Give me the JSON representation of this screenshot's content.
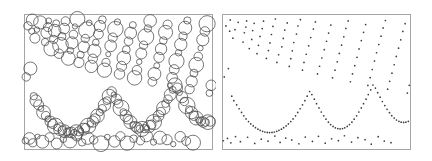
{
  "figure": {
    "type": "two-panel-point-pattern",
    "background_color": "#ffffff",
    "panel_count": 2,
    "title": "",
    "caption": ""
  },
  "panels": [
    {
      "id": "panel-circles",
      "name": "left-panel-circles",
      "label": "",
      "mark_style": "open-circle",
      "mark_stroke_color": "#4a4a4a",
      "mark_fill": "none",
      "frame": {
        "x": 24,
        "y": 14,
        "width": 188,
        "height": 135
      },
      "frame_color": "#8e8e8e",
      "point_count": 194
    },
    {
      "id": "panel-dots",
      "name": "right-panel-dots",
      "label": "",
      "mark_style": "filled-dot",
      "mark_stroke_color": "#3a3a3a",
      "mark_fill": "#3a3a3a",
      "frame": {
        "x": 6,
        "y": 14,
        "width": 188,
        "height": 135
      },
      "frame_color": "#8e8e8e",
      "point_count": 194
    }
  ],
  "chart_data": {
    "type": "scatter",
    "title": "",
    "subtitle": "",
    "xlabel": "",
    "ylabel": "",
    "xlim": [
      0,
      1
    ],
    "ylim": [
      0,
      1
    ],
    "grid": false,
    "legend": null,
    "annotations": [],
    "tick_labels_x": [],
    "tick_labels_y": [],
    "series": [
      {
        "name": "points",
        "marks_encode": "circle radius",
        "radius_min_px": 2.4,
        "radius_max_px": 8.2,
        "x": [
          0.021,
          0.041,
          0.044,
          0.058,
          0.069,
          0.086,
          0.112,
          0.119,
          0.127,
          0.131,
          0.145,
          0.158,
          0.163,
          0.171,
          0.186,
          0.194,
          0.202,
          0.214,
          0.221,
          0.236,
          0.247,
          0.255,
          0.263,
          0.271,
          0.284,
          0.292,
          0.301,
          0.318,
          0.326,
          0.334,
          0.347,
          0.358,
          0.366,
          0.374,
          0.382,
          0.396,
          0.404,
          0.417,
          0.428,
          0.436,
          0.448,
          0.461,
          0.472,
          0.486,
          0.497,
          0.508,
          0.519,
          0.531,
          0.544,
          0.556,
          0.567,
          0.579,
          0.588,
          0.601,
          0.613,
          0.624,
          0.636,
          0.648,
          0.659,
          0.671,
          0.683,
          0.694,
          0.706,
          0.718,
          0.729,
          0.741,
          0.753,
          0.764,
          0.776,
          0.788,
          0.799,
          0.811,
          0.822,
          0.834,
          0.846,
          0.857,
          0.869,
          0.881,
          0.892,
          0.904,
          0.916,
          0.927,
          0.939,
          0.951,
          0.962,
          0.974,
          0.986,
          0.996,
          0.012,
          0.034,
          0.052,
          0.063,
          0.078,
          0.091,
          0.104,
          0.116,
          0.128,
          0.141,
          0.153,
          0.166,
          0.178,
          0.191,
          0.203,
          0.216,
          0.228,
          0.241,
          0.253,
          0.266,
          0.278,
          0.291,
          0.303,
          0.316,
          0.328,
          0.341,
          0.353,
          0.366,
          0.378,
          0.391,
          0.403,
          0.416,
          0.428,
          0.441,
          0.453,
          0.466,
          0.478,
          0.491,
          0.503,
          0.516,
          0.528,
          0.541,
          0.553,
          0.566,
          0.578,
          0.591,
          0.603,
          0.616,
          0.628,
          0.641,
          0.653,
          0.666,
          0.678,
          0.691,
          0.703,
          0.716,
          0.728,
          0.741,
          0.753,
          0.766,
          0.778,
          0.791,
          0.803,
          0.816,
          0.828,
          0.841,
          0.853,
          0.866,
          0.878,
          0.891,
          0.903,
          0.916,
          0.928,
          0.941,
          0.953,
          0.966,
          0.978,
          0.991,
          0.007,
          0.029,
          0.047,
          0.072,
          0.098,
          0.136,
          0.174,
          0.209,
          0.245,
          0.281,
          0.309,
          0.339,
          0.371,
          0.409,
          0.443,
          0.481,
          0.513,
          0.549,
          0.583,
          0.619,
          0.651,
          0.689,
          0.723,
          0.761,
          0.794,
          0.831,
          0.863,
          0.899
        ],
        "y": [
          0.912,
          0.873,
          0.956,
          0.821,
          0.884,
          0.938,
          0.792,
          0.861,
          0.903,
          0.949,
          0.744,
          0.812,
          0.877,
          0.931,
          0.706,
          0.768,
          0.834,
          0.892,
          0.947,
          0.671,
          0.729,
          0.786,
          0.848,
          0.908,
          0.963,
          0.641,
          0.698,
          0.757,
          0.819,
          0.881,
          0.934,
          0.612,
          0.669,
          0.727,
          0.789,
          0.851,
          0.911,
          0.958,
          0.584,
          0.641,
          0.702,
          0.764,
          0.826,
          0.888,
          0.941,
          0.556,
          0.613,
          0.674,
          0.736,
          0.798,
          0.859,
          0.918,
          0.527,
          0.584,
          0.646,
          0.708,
          0.769,
          0.831,
          0.893,
          0.949,
          0.498,
          0.556,
          0.617,
          0.679,
          0.741,
          0.803,
          0.864,
          0.922,
          0.471,
          0.528,
          0.589,
          0.651,
          0.713,
          0.774,
          0.836,
          0.897,
          0.952,
          0.443,
          0.501,
          0.562,
          0.624,
          0.686,
          0.747,
          0.809,
          0.871,
          0.928,
          0.414,
          0.472,
          0.534,
          0.596,
          0.391,
          0.358,
          0.327,
          0.298,
          0.271,
          0.246,
          0.223,
          0.203,
          0.186,
          0.171,
          0.158,
          0.147,
          0.138,
          0.131,
          0.126,
          0.123,
          0.122,
          0.123,
          0.126,
          0.131,
          0.138,
          0.147,
          0.158,
          0.171,
          0.186,
          0.203,
          0.223,
          0.246,
          0.271,
          0.298,
          0.327,
          0.358,
          0.391,
          0.426,
          0.403,
          0.369,
          0.336,
          0.304,
          0.274,
          0.246,
          0.221,
          0.199,
          0.181,
          0.167,
          0.157,
          0.151,
          0.149,
          0.151,
          0.157,
          0.167,
          0.181,
          0.199,
          0.221,
          0.246,
          0.274,
          0.304,
          0.336,
          0.369,
          0.403,
          0.438,
          0.474,
          0.451,
          0.417,
          0.384,
          0.352,
          0.322,
          0.294,
          0.269,
          0.247,
          0.229,
          0.215,
          0.205,
          0.199,
          0.197,
          0.199,
          0.205,
          0.061,
          0.078,
          0.046,
          0.092,
          0.054,
          0.087,
          0.041,
          0.073,
          0.058,
          0.096,
          0.049,
          0.081,
          0.067,
          0.039,
          0.088,
          0.056,
          0.094,
          0.043,
          0.076,
          0.062,
          0.098,
          0.051,
          0.084,
          0.069,
          0.036,
          0.091,
          0.059,
          0.047
        ],
        "marks": [
          4.1,
          3.2,
          5.6,
          4.8,
          2.9,
          6.1,
          3.7,
          5.2,
          4.4,
          3.1,
          6.8,
          4.0,
          5.9,
          3.5,
          4.6,
          7.2,
          3.9,
          5.1,
          4.3,
          6.4,
          3.3,
          5.7,
          4.2,
          2.8,
          6.9,
          4.9,
          3.6,
          5.4,
          4.1,
          7.5,
          3.0,
          5.8,
          4.5,
          6.2,
          3.4,
          4.7,
          5.3,
          3.8,
          6.6,
          4.0,
          2.7,
          5.5,
          4.4,
          7.1,
          3.2,
          5.0,
          4.8,
          6.3,
          3.9,
          4.2,
          5.6,
          3.5,
          6.7,
          4.6,
          2.9,
          5.2,
          4.1,
          7.3,
          3.7,
          5.9,
          4.3,
          6.0,
          3.1,
          4.9,
          5.4,
          3.8,
          6.5,
          4.4,
          2.6,
          5.1,
          4.7,
          7.0,
          3.3,
          5.8,
          4.0,
          6.2,
          3.6,
          4.5,
          5.3,
          3.9,
          6.8,
          4.2,
          2.8,
          5.7,
          4.6,
          7.4,
          3.4,
          5.0,
          4.1,
          6.1,
          3.7,
          5.5,
          4.8,
          2.9,
          6.4,
          4.3,
          3.2,
          5.2,
          4.5,
          7.2,
          3.5,
          5.9,
          4.0,
          6.0,
          3.8,
          4.7,
          5.1,
          3.1,
          6.7,
          4.4,
          2.7,
          5.6,
          4.2,
          7.1,
          3.3,
          5.3,
          4.9,
          6.3,
          3.6,
          4.1,
          5.8,
          3.9,
          6.5,
          4.6,
          2.8,
          5.0,
          4.3,
          7.3,
          3.4,
          5.4,
          4.7,
          6.1,
          3.0,
          4.8,
          5.2,
          3.7,
          6.9,
          4.0,
          2.6,
          5.7,
          4.4,
          7.0,
          3.2,
          5.1,
          4.5,
          6.2,
          3.8,
          4.2,
          5.6,
          3.5,
          6.6,
          4.9,
          2.9,
          5.3,
          4.1,
          7.5,
          3.6,
          5.8,
          4.6,
          6.4,
          3.1,
          4.3,
          5.0,
          3.9,
          6.8,
          4.7,
          3.3,
          5.5,
          4.0,
          2.7,
          6.0,
          4.4,
          5.2,
          3.4,
          6.3,
          4.8,
          3.7,
          5.9,
          4.1,
          7.2,
          3.0,
          5.4,
          4.5,
          6.6,
          3.8,
          4.2,
          5.7,
          3.2,
          6.1,
          4.9,
          2.8,
          5.0,
          4.3,
          6.9
        ]
      }
    ]
  }
}
